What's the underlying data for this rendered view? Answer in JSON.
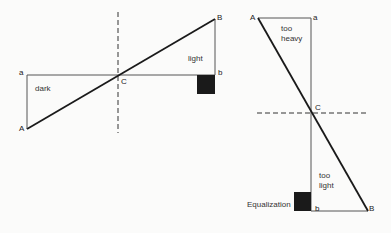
{
  "left_figure": {
    "points": {
      "A": "A",
      "a": "a",
      "B": "B",
      "b": "b",
      "C": "C"
    },
    "region_labels": {
      "dark": "dark",
      "light": "light"
    }
  },
  "right_figure": {
    "points": {
      "A": "A",
      "a": "a",
      "B": "B",
      "b": "b",
      "C": "C"
    },
    "region_labels": {
      "too_heavy_1": "too",
      "too_heavy_2": "heavy",
      "too_light_1": "too",
      "too_light_2": "light"
    },
    "equalization_label": "Equalization"
  },
  "colors": {
    "line": "#1a1a1a",
    "thin_line": "#555555",
    "box": "#1a1a1a",
    "background": "#fbfbfa"
  }
}
